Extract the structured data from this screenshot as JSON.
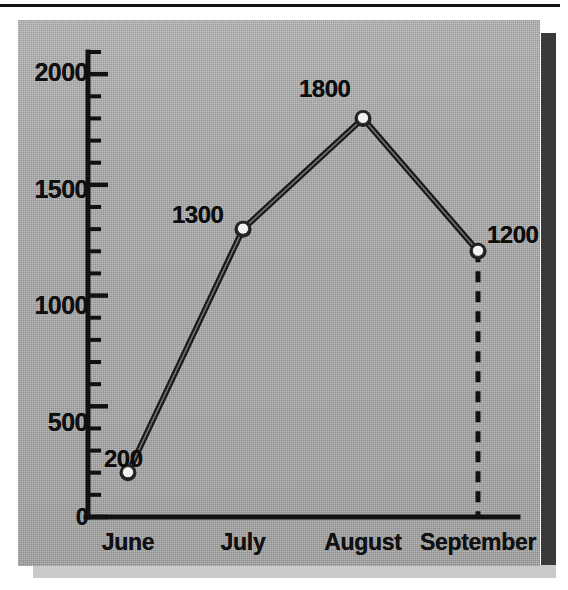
{
  "figure": {
    "name": "monthly-line-chart",
    "background_color": "#a9a9a9",
    "ink_color": "#111111",
    "marker_fill": "#f2f2f2"
  },
  "chart_data": {
    "type": "line",
    "title": "",
    "subtitle": "",
    "xlabel": "",
    "ylabel": "",
    "categories": [
      "June",
      "July",
      "August",
      "September"
    ],
    "values": [
      200,
      1300,
      1800,
      1200
    ],
    "point_labels": [
      "200",
      "1300",
      "1800",
      "1200"
    ],
    "series": [
      {
        "name": "",
        "values": [
          200,
          1300,
          1800,
          1200
        ]
      }
    ],
    "ylim": [
      0,
      2100
    ],
    "xlim": [
      0,
      5
    ],
    "y_major_ticks": [
      0,
      500,
      1000,
      1500,
      2000
    ],
    "y_major_tick_labels": [
      "0",
      "500",
      "1000",
      "1500",
      "2000"
    ],
    "y_minor_tick_step": 100,
    "y_minor_ticks": [
      100,
      200,
      300,
      400,
      600,
      700,
      800,
      900,
      1100,
      1200,
      1300,
      1400,
      1600,
      1700,
      1800,
      1900,
      2000,
      2100
    ],
    "grid": false,
    "legend": false,
    "legend_position": "none",
    "annotations": [
      {
        "name": "september-dropline",
        "type": "dashed-vertical-line",
        "from_value": 1200,
        "to_value": 0,
        "category": "September"
      }
    ],
    "marker": "circle-open-white",
    "line_style": "solid",
    "extra_tick_label": {
      "value": 200,
      "text": "200",
      "note": "value label sits beside the y-axis at the 200 level"
    }
  },
  "axes": {
    "y_tick_labels": [
      "2000",
      "1500",
      "1000",
      "500",
      "0"
    ],
    "x_tick_labels": [
      "June",
      "July",
      "August",
      "September"
    ],
    "zero_label": "0"
  }
}
